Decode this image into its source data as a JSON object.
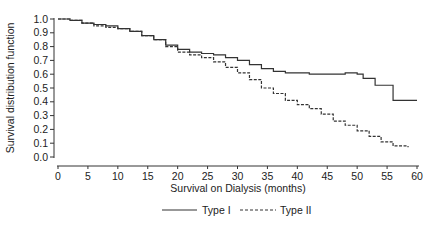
{
  "chart_data": {
    "type": "line",
    "title": "",
    "xlabel": "Survival on Dialysis (months)",
    "ylabel": "Survival distribution function",
    "xlim": [
      0,
      60
    ],
    "ylim": [
      0,
      1.0
    ],
    "x_ticks": [
      0,
      5,
      10,
      15,
      20,
      25,
      30,
      35,
      40,
      45,
      50,
      55,
      60
    ],
    "y_ticks": [
      "0.0",
      "0.1",
      "0.2",
      "0.3",
      "0.4",
      "0.5",
      "0.6",
      "0.7",
      "0.8",
      "0.9",
      "1.0"
    ],
    "grid": false,
    "legend_position": "bottom",
    "series": [
      {
        "name": "Type I",
        "style": "solid",
        "step": true,
        "x": [
          0,
          2,
          4,
          6,
          8,
          10,
          12,
          14,
          16,
          18,
          20,
          22,
          24,
          26,
          28,
          30,
          32,
          34,
          36,
          38,
          40,
          42,
          44,
          46,
          48,
          50,
          51,
          53,
          56,
          60
        ],
        "y": [
          1.0,
          0.99,
          0.97,
          0.96,
          0.95,
          0.93,
          0.91,
          0.88,
          0.85,
          0.81,
          0.78,
          0.76,
          0.75,
          0.74,
          0.72,
          0.7,
          0.67,
          0.64,
          0.62,
          0.61,
          0.61,
          0.6,
          0.6,
          0.6,
          0.61,
          0.6,
          0.57,
          0.52,
          0.41,
          0.41
        ]
      },
      {
        "name": "Type II",
        "style": "dashed",
        "step": true,
        "x": [
          0,
          2,
          4,
          6,
          8,
          10,
          12,
          14,
          16,
          18,
          20,
          22,
          24,
          26,
          28,
          30,
          32,
          34,
          36,
          38,
          40,
          42,
          44,
          46,
          48,
          50,
          52,
          54,
          56,
          58.5
        ],
        "y": [
          1.0,
          0.99,
          0.97,
          0.95,
          0.94,
          0.93,
          0.91,
          0.88,
          0.85,
          0.8,
          0.76,
          0.74,
          0.72,
          0.69,
          0.65,
          0.61,
          0.56,
          0.5,
          0.46,
          0.41,
          0.38,
          0.35,
          0.31,
          0.26,
          0.23,
          0.19,
          0.15,
          0.11,
          0.08,
          0.07
        ]
      }
    ]
  },
  "legend": {
    "items": [
      {
        "label": "Type I"
      },
      {
        "label": "Type II"
      }
    ]
  }
}
